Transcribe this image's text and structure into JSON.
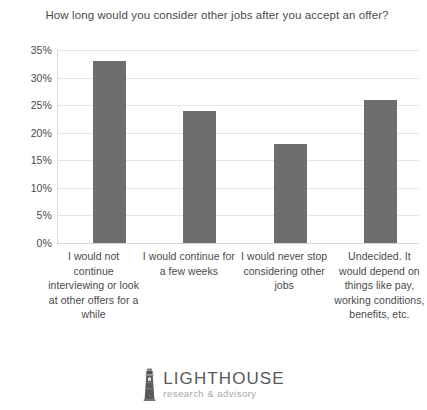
{
  "chart_data": {
    "type": "bar",
    "title": "How long would you consider other jobs after you accept an offer?",
    "categories": [
      "I would not continue interviewing or look at other offers for a while",
      "I would continue for a few weeks",
      "I would never stop considering other jobs",
      "Undecided. It would depend on things like pay, working conditions, benefits, etc."
    ],
    "values": [
      33,
      24,
      18,
      26
    ],
    "value_labels": [
      "33%",
      "24%",
      "18%",
      "26%"
    ],
    "xlabel": "",
    "ylabel": "",
    "ylim": [
      0,
      35
    ],
    "ytick_labels": [
      "35%",
      "30%",
      "25%",
      "20%",
      "15%",
      "10%",
      "5%",
      "0%"
    ],
    "ytick_values": [
      35,
      30,
      25,
      20,
      15,
      10,
      5,
      0
    ],
    "grid": true,
    "legend": "none",
    "bar_color": "#6e6e6e",
    "grid_color": "#e4e4e4",
    "text_color": "#4a4a4a",
    "background_color": "#ffffff"
  },
  "logo": {
    "icon": "lighthouse-icon",
    "name": "LIGHTHOUSE",
    "tagline": "research & advisory",
    "name_color": "#595959",
    "tagline_color": "#a8a8a8"
  }
}
